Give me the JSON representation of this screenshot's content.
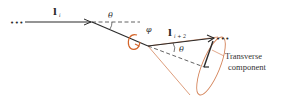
{
  "diagram": {
    "type": "bond-vector cone diagram",
    "labels": {
      "bond_i": "l",
      "bond_i_sub": "i",
      "bond_i2": "l",
      "bond_i2_sub": "i + 2",
      "theta_top": "θ",
      "theta_cone": "θ",
      "phi": "φ",
      "ellipsis_left": "•••",
      "ellipsis_right": "•••",
      "transverse_line1": "Transverse",
      "transverse_line2": "component"
    },
    "colors": {
      "line": "#2b2b2b",
      "dashed": "#3a3a3a",
      "cone": "#d4845a",
      "rotation_arrow": "#d4652a",
      "text": "#333333"
    }
  }
}
